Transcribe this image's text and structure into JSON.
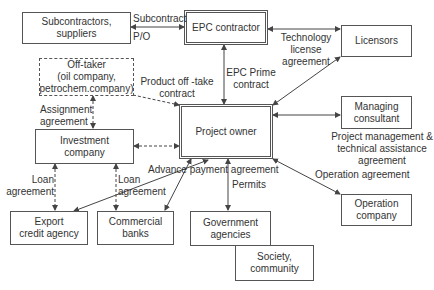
{
  "diagram": {
    "nodes": {
      "subcontractors": "Subcontractors,\nsuppliers",
      "epc_contractor": "EPC contractor",
      "licensors": "Licensors",
      "off_taker": "Off-taker\n(oil company,\npetrochem.company)",
      "project_owner": "Project owner",
      "managing_consultant": "Managing\nconsultant",
      "investment_company": "Investment\ncompany",
      "export_credit_agency": "Export\ncredit agency",
      "commercial_banks": "Commercial\nbanks",
      "government_agencies": "Government\nagencies",
      "society_community": "Society,\ncommunity",
      "operation_company": "Operation\ncompany"
    },
    "edges": {
      "subcontract": "Subcontract",
      "po": "P/O",
      "technology_license": "Technology\nlicense\nagreement",
      "epc_prime": "EPC Prime\ncontract",
      "product_offtake": "Product off -take\ncontract",
      "assignment": "Assignment\nagreement",
      "project_management": "Project management &\ntechnical assistance\nagreement",
      "loan_eca": "Loan\nagreement",
      "loan_banks": "Loan\nagreement",
      "advance_payment": "Advance payment agreement",
      "permits": "Permits",
      "operation": "Operation agreement"
    }
  }
}
